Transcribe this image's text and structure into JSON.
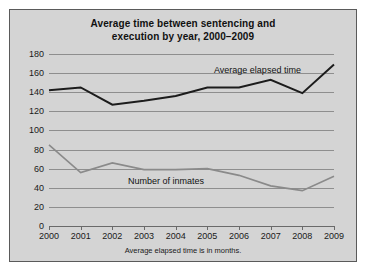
{
  "chart_data": {
    "type": "line",
    "title": "Average time between sentencing and execution by year, 2000–2009",
    "title_line1": "Average time between sentencing and",
    "title_line2": "execution by year, 2000–2009",
    "footnote": "Average elapsed time is in months.",
    "xlabel": "",
    "ylabel": "",
    "categories": [
      "2000",
      "2001",
      "2002",
      "2003",
      "2004",
      "2005",
      "2006",
      "2007",
      "2008",
      "2009"
    ],
    "x": [
      2000,
      2001,
      2002,
      2003,
      2004,
      2005,
      2006,
      2007,
      2008,
      2009
    ],
    "ylim": [
      0,
      180
    ],
    "ytick_step": 20,
    "yticks": [
      "0",
      "20",
      "40",
      "60",
      "80",
      "100",
      "120",
      "140",
      "160",
      "180"
    ],
    "grid": true,
    "legend_position": "inline-annotations",
    "series": [
      {
        "name": "Average elapsed time",
        "color": "#1c1c1c",
        "values": [
          142,
          145,
          127,
          131,
          136,
          145,
          145,
          153,
          139,
          169
        ]
      },
      {
        "name": "Number of inmates",
        "color": "#8a8a8a",
        "values": [
          85,
          56,
          66,
          59,
          59,
          60,
          53,
          42,
          37,
          52
        ]
      }
    ],
    "annotations": [
      {
        "text": "Average elapsed time",
        "series": "Average elapsed time"
      },
      {
        "text": "Number of inmates",
        "series": "Number of inmates"
      }
    ]
  }
}
